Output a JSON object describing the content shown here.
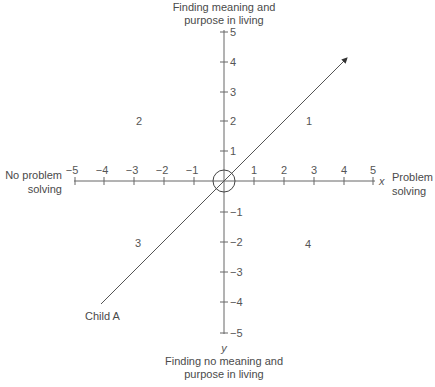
{
  "diagram": {
    "top_label": [
      "Finding meaning and",
      "purpose in living"
    ],
    "bottom_label": [
      "Finding no meaning and",
      "purpose in living"
    ],
    "left_label": [
      "No problem",
      "solving"
    ],
    "right_label": [
      "Problem",
      "solving"
    ],
    "x_var": "x",
    "y_var": "y",
    "x_ticks": [
      "−5",
      "−4",
      "−3",
      "−2",
      "−1",
      "1",
      "2",
      "3",
      "4",
      "5"
    ],
    "y_ticks_pos": [
      "5",
      "4",
      "3",
      "2",
      "1"
    ],
    "y_ticks_neg": [
      "−1",
      "−2",
      "−3",
      "−4",
      "−5"
    ],
    "quadrants": {
      "q1": "1",
      "q2": "2",
      "q3": "3",
      "q4": "4"
    },
    "vector_label": "Child A",
    "colors": {
      "axis": "#666666",
      "text": "#4a4a4a",
      "line": "#555555"
    }
  }
}
